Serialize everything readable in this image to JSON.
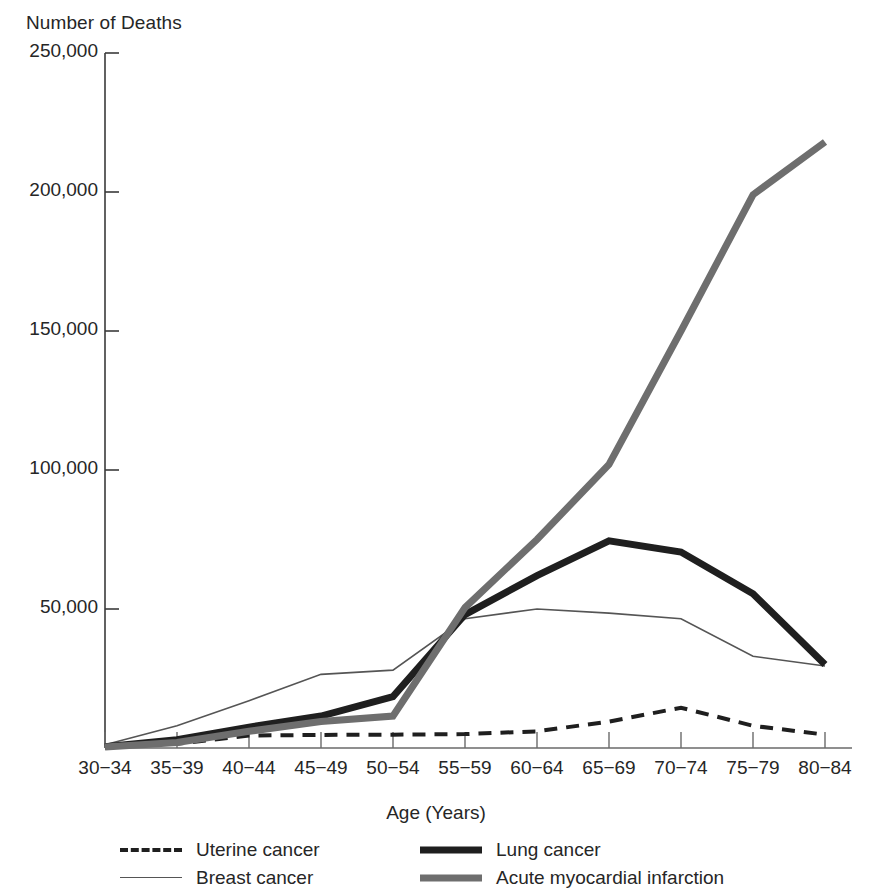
{
  "chart_data": {
    "type": "line",
    "title": "",
    "ylabel": "Number of Deaths",
    "xlabel": "Age (Years)",
    "categories": [
      "30−34",
      "35−39",
      "40−44",
      "45−49",
      "50−54",
      "55−59",
      "60−64",
      "65−69",
      "70−74",
      "75−79",
      "80−84"
    ],
    "ylim": [
      0,
      250000
    ],
    "yticks": [
      0,
      50000,
      100000,
      150000,
      200000,
      250000
    ],
    "ytick_labels": [
      "",
      "50,000",
      "100,000",
      "150,000",
      "200,000",
      "250,000"
    ],
    "grid": false,
    "legend_position": "bottom",
    "series": [
      {
        "name": "Uterine cancer",
        "style": "dashed",
        "color": "#1f1f1f",
        "width": 4,
        "values": [
          600,
          1500,
          4500,
          4700,
          4800,
          5000,
          6000,
          9500,
          14500,
          8000,
          4800
        ]
      },
      {
        "name": "Breast cancer",
        "style": "thin",
        "color": "#555555",
        "width": 1.6,
        "values": [
          1200,
          8000,
          17000,
          26500,
          28000,
          46500,
          50000,
          48500,
          46500,
          33000,
          29500
        ]
      },
      {
        "name": "Lung cancer",
        "style": "thick",
        "color": "#1f1f1f",
        "width": 7,
        "values": [
          500,
          3000,
          7500,
          11500,
          18500,
          48000,
          62000,
          74500,
          70500,
          55500,
          30000
        ]
      },
      {
        "name": "Acute myocardial infarction",
        "style": "thick",
        "color": "#6e6e6e",
        "width": 7,
        "values": [
          400,
          2000,
          6000,
          9500,
          11500,
          50500,
          75000,
          102000,
          150000,
          199000,
          218000
        ]
      }
    ]
  },
  "legend": {
    "entries": [
      {
        "label": "Uterine cancer"
      },
      {
        "label": "Lung cancer"
      },
      {
        "label": "Breast cancer"
      },
      {
        "label": "Acute myocardial infarction"
      }
    ]
  }
}
